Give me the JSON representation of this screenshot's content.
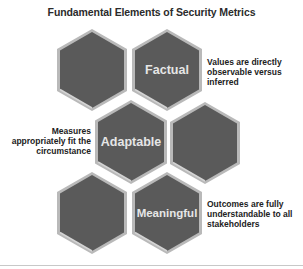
{
  "title": "Fundamental Elements of Security Metrics",
  "colors": {
    "hex_fill": "#5a5a5a",
    "hex_edge": "#b9b9b9",
    "label_text": "#e6e6e6",
    "desc_text": "#222222"
  },
  "hexagons": [
    {
      "id": "h1",
      "label": ""
    },
    {
      "id": "h2",
      "label": "Factual"
    },
    {
      "id": "h3",
      "label": "Adaptable"
    },
    {
      "id": "h4",
      "label": ""
    },
    {
      "id": "h5",
      "label": ""
    },
    {
      "id": "h6",
      "label": "Meaningful"
    }
  ],
  "descriptions": {
    "factual": "Values are directly observable versus inferred",
    "adaptable": "Measures appropriately fit the circumstance",
    "meaningful": "Outcomes are fully understandable to all stakeholders"
  },
  "descriptions_lines": {
    "factual": [
      "Values are directly",
      "observable versus",
      "inferred"
    ],
    "adaptable": [
      "Measures",
      "appropriately fit the",
      "circumstance"
    ],
    "meaningful": [
      "Outcomes are fully",
      "understandable to all",
      "stakeholders"
    ]
  }
}
